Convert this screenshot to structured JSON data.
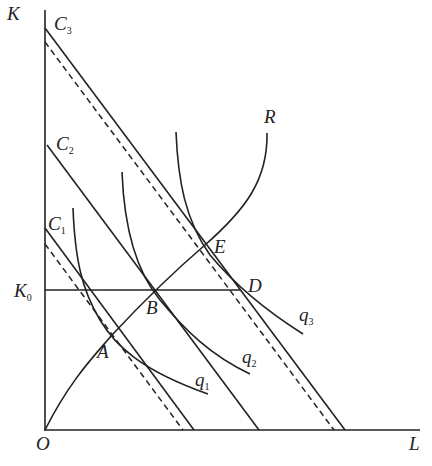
{
  "diagram": {
    "axes": {
      "y_label": "K",
      "x_label": "L",
      "origin_label": "O",
      "k0_label": "K",
      "k0_sub": "0"
    },
    "isocost_lines": [
      {
        "label": "C",
        "sub": "3"
      },
      {
        "label": "C",
        "sub": "2"
      },
      {
        "label": "C",
        "sub": "1"
      }
    ],
    "isoquants": [
      {
        "label": "q",
        "sub": "1"
      },
      {
        "label": "q",
        "sub": "2"
      },
      {
        "label": "q",
        "sub": "3"
      }
    ],
    "expansion_path": {
      "label": "R"
    },
    "points": {
      "A": "A",
      "B": "B",
      "D": "D",
      "E": "E"
    },
    "color": "#222222"
  }
}
